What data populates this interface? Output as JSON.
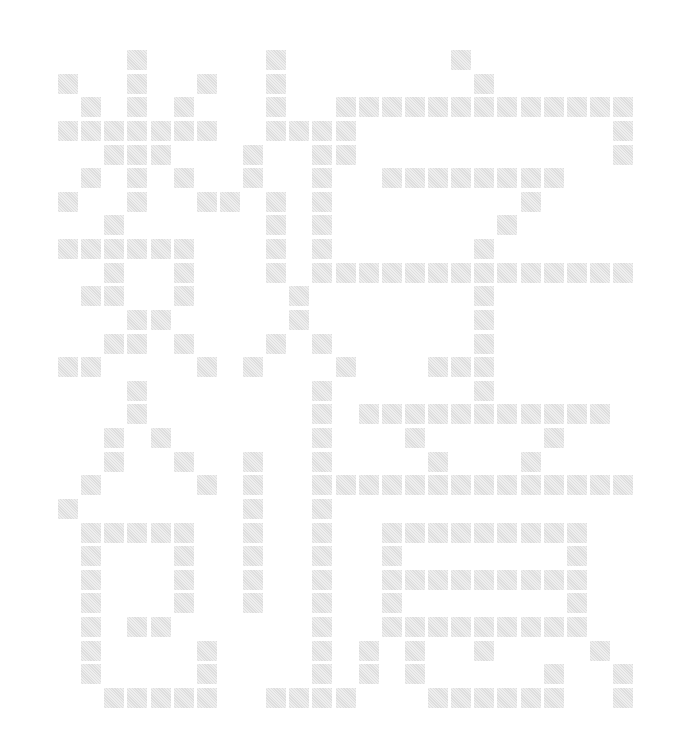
{
  "title": "数字创意",
  "characters": [
    "数",
    "字",
    "创",
    "意"
  ],
  "grid": {
    "cols": 25,
    "rows": 28,
    "origin_x": 58,
    "origin_y": 50,
    "pitch_x": 23.125,
    "pitch_y": 23.63,
    "cell_size": 20,
    "cell_color": "#e5e5e5",
    "background": "#ffffff"
  },
  "filled_cells": [
    [
      3,
      9,
      17
    ],
    [
      0,
      3,
      6,
      9,
      18
    ],
    [
      1,
      3,
      5,
      9,
      12,
      13,
      14,
      15,
      16,
      17,
      18,
      19,
      20,
      21,
      22,
      23,
      24
    ],
    [
      0,
      1,
      2,
      3,
      4,
      5,
      6,
      9,
      10,
      11,
      12,
      24
    ],
    [
      2,
      3,
      4,
      8,
      11,
      12,
      24
    ],
    [
      1,
      3,
      5,
      8,
      11,
      14,
      15,
      16,
      17,
      18,
      19,
      20,
      21
    ],
    [
      0,
      3,
      6,
      7,
      9,
      11,
      20
    ],
    [
      2,
      9,
      11,
      19
    ],
    [
      0,
      1,
      2,
      3,
      4,
      5,
      9,
      11,
      18
    ],
    [
      2,
      5,
      9,
      11,
      12,
      13,
      14,
      15,
      16,
      17,
      18,
      19,
      20,
      21,
      22,
      23,
      24
    ],
    [
      1,
      2,
      5,
      10,
      18
    ],
    [
      3,
      4,
      10,
      18
    ],
    [
      2,
      3,
      5,
      9,
      11,
      18
    ],
    [
      0,
      1,
      6,
      8,
      12,
      16,
      17,
      18
    ],
    [
      3,
      11,
      18
    ],
    [
      3,
      11,
      13,
      14,
      15,
      16,
      17,
      18,
      19,
      20,
      21,
      22,
      23
    ],
    [
      2,
      4,
      11,
      15,
      21
    ],
    [
      2,
      5,
      8,
      11,
      16,
      20
    ],
    [
      1,
      6,
      8,
      11,
      12,
      13,
      14,
      15,
      16,
      17,
      18,
      19,
      20,
      21,
      22,
      23,
      24
    ],
    [
      0,
      8,
      11
    ],
    [
      1,
      2,
      3,
      4,
      5,
      8,
      11,
      14,
      15,
      16,
      17,
      18,
      19,
      20,
      21,
      22
    ],
    [
      1,
      5,
      8,
      11,
      14,
      22
    ],
    [
      1,
      5,
      8,
      11,
      14,
      15,
      16,
      17,
      18,
      19,
      20,
      21,
      22
    ],
    [
      1,
      5,
      8,
      11,
      14,
      22
    ],
    [
      1,
      3,
      4,
      11,
      14,
      15,
      16,
      17,
      18,
      19,
      20,
      21,
      22
    ],
    [
      1,
      6,
      11,
      13,
      15,
      18,
      23
    ],
    [
      1,
      6,
      11,
      13,
      15,
      21,
      24
    ],
    [
      2,
      3,
      4,
      5,
      6,
      9,
      10,
      11,
      12,
      16,
      17,
      18,
      19,
      20,
      21,
      24
    ]
  ]
}
